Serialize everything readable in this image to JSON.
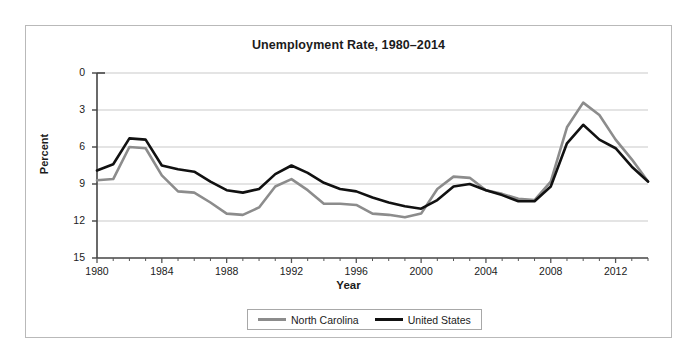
{
  "figure": {
    "title": "Unemployment Rate, 1980–2014",
    "background_color": "#ffffff",
    "frame_color": "#b9b9b9"
  },
  "axes": {
    "ylabel": "Percent",
    "xlabel": "Year",
    "y_ticks": [
      "15",
      "12",
      "9",
      "6",
      "3",
      "0"
    ],
    "x_ticks": [
      "1980",
      "1984",
      "1988",
      "1992",
      "1996",
      "2000",
      "2004",
      "2008",
      "2012"
    ]
  },
  "legend": {
    "position": "bottom-center",
    "items": [
      {
        "label": "North Carolina",
        "color": "#8c8c8c"
      },
      {
        "label": "United States",
        "color": "#111111"
      }
    ]
  },
  "chart_data": {
    "type": "line",
    "title": "Unemployment Rate, 1980–2014",
    "xlabel": "Year",
    "ylabel": "Percent",
    "xlim": [
      1980,
      2014
    ],
    "ylim": [
      0,
      15
    ],
    "ytick_values": [
      0,
      3,
      6,
      9,
      12,
      15
    ],
    "xtick_values": [
      1980,
      1984,
      1988,
      1992,
      1996,
      2000,
      2004,
      2008,
      2012
    ],
    "grid": "horizontal",
    "legend_position": "bottom-center",
    "x": [
      1980,
      1981,
      1982,
      1983,
      1984,
      1985,
      1986,
      1987,
      1988,
      1989,
      1990,
      1991,
      1992,
      1993,
      1994,
      1995,
      1996,
      1997,
      1998,
      1999,
      2000,
      2001,
      2002,
      2003,
      2004,
      2005,
      2006,
      2007,
      2008,
      2009,
      2010,
      2011,
      2012,
      2013,
      2014
    ],
    "series": [
      {
        "name": "North Carolina",
        "color": "#8c8c8c",
        "values": [
          6.3,
          6.4,
          9.0,
          8.9,
          6.7,
          5.4,
          5.3,
          4.5,
          3.6,
          3.5,
          4.1,
          5.8,
          6.4,
          5.5,
          4.4,
          4.4,
          4.3,
          3.6,
          3.5,
          3.3,
          3.6,
          5.6,
          6.6,
          6.5,
          5.5,
          5.2,
          4.8,
          4.7,
          6.2,
          10.6,
          12.6,
          11.6,
          9.6,
          8.0,
          6.2
        ]
      },
      {
        "name": "United States",
        "color": "#111111",
        "values": [
          7.1,
          7.6,
          9.7,
          9.6,
          7.5,
          7.2,
          7.0,
          6.2,
          5.5,
          5.3,
          5.6,
          6.8,
          7.5,
          6.9,
          6.1,
          5.6,
          5.4,
          4.9,
          4.5,
          4.2,
          4.0,
          4.7,
          5.8,
          6.0,
          5.5,
          5.1,
          4.6,
          4.6,
          5.8,
          9.3,
          10.8,
          9.6,
          8.9,
          7.4,
          6.2
        ]
      }
    ]
  }
}
